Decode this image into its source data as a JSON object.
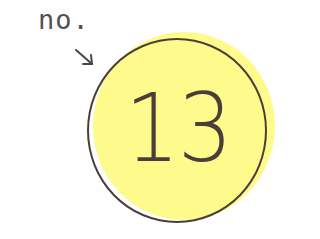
{
  "label": {
    "prefix": "no.",
    "arrow_icon": "arrow-down-right-icon"
  },
  "badge": {
    "number": "13",
    "fill_color": "#fffa8c",
    "outline_color": "#4a3f38"
  }
}
